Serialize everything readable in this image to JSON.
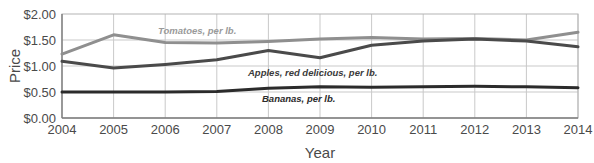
{
  "chart_data": {
    "type": "line",
    "title": "",
    "xlabel": "Year",
    "ylabel": "Price",
    "x": [
      2004,
      2005,
      2006,
      2007,
      2008,
      2009,
      2010,
      2011,
      2012,
      2013,
      2014
    ],
    "categories": [
      "2004",
      "2005",
      "2006",
      "2007",
      "2008",
      "2009",
      "2010",
      "2011",
      "2012",
      "2013",
      "2014"
    ],
    "xlim": [
      2004,
      2014
    ],
    "ylim": [
      0.0,
      2.0
    ],
    "ytick_labels": [
      "$2.00",
      "$1.50",
      "$1.00",
      "$0.50",
      "$0.00"
    ],
    "ytick_values": [
      2.0,
      1.5,
      1.0,
      0.5,
      0.0
    ],
    "grid": true,
    "legend_position": "inline-labels",
    "series": [
      {
        "name": "Tomatoes, per lb.",
        "label": "Tomatoes, per lb.",
        "color": "#8f8f8f",
        "values": [
          1.23,
          1.6,
          1.45,
          1.44,
          1.47,
          1.52,
          1.55,
          1.52,
          1.53,
          1.5,
          1.65
        ]
      },
      {
        "name": "Apples, red delicious, per lb.",
        "label": "Apples, red delicious, per lb.",
        "color": "#4a4a4a",
        "values": [
          1.09,
          0.96,
          1.03,
          1.12,
          1.3,
          1.16,
          1.4,
          1.48,
          1.52,
          1.48,
          1.37
        ]
      },
      {
        "name": "Bananas, per lb.",
        "label": "Bananas, per lb.",
        "color": "#2b2b2b",
        "values": [
          0.5,
          0.5,
          0.5,
          0.51,
          0.57,
          0.6,
          0.59,
          0.6,
          0.61,
          0.6,
          0.58
        ]
      }
    ]
  },
  "axes": {
    "y_label": "Price",
    "x_label": "Year"
  },
  "labels": {
    "tomatoes": "Tomatoes, per lb.",
    "apples": "Apples, red delicious, per lb.",
    "bananas": "Bananas, per lb."
  },
  "ticks": {
    "y": [
      "$2.00",
      "$1.50",
      "$1.00",
      "$0.50",
      "$0.00"
    ],
    "x": [
      "2004",
      "2005",
      "2006",
      "2007",
      "2008",
      "2009",
      "2010",
      "2011",
      "2012",
      "2013",
      "2014"
    ]
  },
  "colors": {
    "tomatoes": "#8f8f8f",
    "apples": "#4a4a4a",
    "bananas": "#2b2b2b",
    "grid": "#c9c9c9",
    "axis": "#8a8a8a",
    "text": "#4a4a4a"
  }
}
